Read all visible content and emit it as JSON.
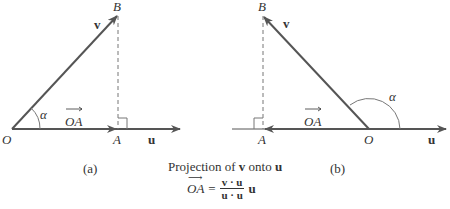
{
  "figure": {
    "panel_a": {
      "label": "(a)",
      "points": {
        "O": "O",
        "A": "A",
        "B": "B"
      },
      "vector_v": "v",
      "vector_u": "u",
      "angle": "α",
      "projection": "OA"
    },
    "panel_b": {
      "label": "(b)",
      "points": {
        "O": "O",
        "A": "A",
        "B": "B"
      },
      "vector_v": "v",
      "vector_u": "u",
      "angle": "α",
      "projection": "OA"
    },
    "caption": {
      "title_pre": "Projection of ",
      "title_v": "v",
      "title_mid": " onto ",
      "title_u": "u",
      "formula_lhs": "OA",
      "formula_eq": "=",
      "numerator": "v · u",
      "denominator": "u · u",
      "formula_rhs": "u"
    }
  },
  "colors": {
    "line": "#555555",
    "text": "#333333"
  }
}
